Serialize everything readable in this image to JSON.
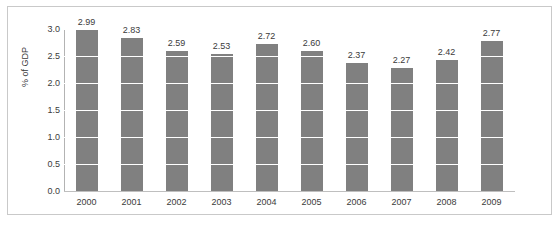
{
  "chart_data": {
    "type": "bar",
    "title": "",
    "xlabel": "",
    "ylabel": "% of GDP",
    "categories": [
      "2000",
      "2001",
      "2002",
      "2003",
      "2004",
      "2005",
      "2006",
      "2007",
      "2008",
      "2009"
    ],
    "values": [
      2.99,
      2.83,
      2.59,
      2.53,
      2.72,
      2.6,
      2.37,
      2.27,
      2.42,
      2.77
    ],
    "value_labels": [
      "2.99",
      "2.83",
      "2.59",
      "2.53",
      "2.72",
      "2.60",
      "2.37",
      "2.27",
      "2.42",
      "2.77"
    ],
    "ylim": [
      0.0,
      3.0
    ],
    "ytick_labels": [
      "3.0",
      "2.5",
      "2.0",
      "1.5",
      "1.0",
      "0.5",
      "0.0"
    ],
    "ytick_values": [
      3.0,
      2.5,
      2.0,
      1.5,
      1.0,
      0.5,
      0.0
    ],
    "grid": true,
    "grid_color": "#ffffff",
    "legend": null,
    "series_color": "#808080",
    "axis_color": "#bfbfbf",
    "text_color": "#3b3b3b",
    "data_labels_shown": true
  }
}
